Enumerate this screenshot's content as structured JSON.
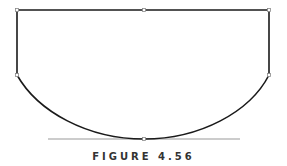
{
  "figure": {
    "caption": "FIGURE 4.56",
    "colors": {
      "path": "#1a1a1a",
      "handle": "#999999",
      "anchor_fill": "#ffffff",
      "anchor_stroke": "#888888"
    },
    "anchors": [
      {
        "name": "top-left",
        "x": 17,
        "y": 10
      },
      {
        "name": "top-mid",
        "x": 144,
        "y": 10
      },
      {
        "name": "top-right",
        "x": 269,
        "y": 10
      },
      {
        "name": "left-mid",
        "x": 17,
        "y": 75
      },
      {
        "name": "right-mid",
        "x": 269,
        "y": 75
      },
      {
        "name": "bottom",
        "x": 144,
        "y": 139
      }
    ],
    "handle": {
      "x1": 48,
      "y1": 139,
      "x2": 240,
      "y2": 139
    }
  }
}
